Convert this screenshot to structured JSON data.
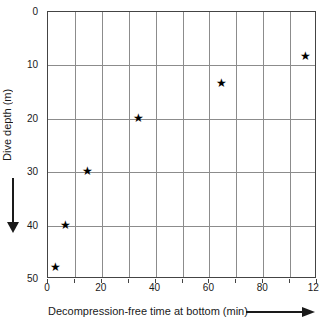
{
  "figure": {
    "background": "#ffffff",
    "text_color": "#1a1a1a",
    "grid_color": "#8c8c8c",
    "border_color": "#444444",
    "marker_glyph": "★",
    "marker_color": "#000000"
  },
  "chart_data": {
    "type": "scatter",
    "title": "",
    "xlabel": "Decompression-free time at bottom (min)",
    "ylabel": "Dive depth (m)",
    "x_tick_labels": [
      "0",
      "20",
      "40",
      "60",
      "80",
      "120"
    ],
    "x_tick_fracs": [
      0,
      0.2,
      0.4,
      0.6,
      0.8,
      1.0
    ],
    "y_tick_labels": [
      "0",
      "10",
      "20",
      "30",
      "40",
      "50"
    ],
    "y_tick_fracs": [
      0,
      0.2,
      0.4,
      0.6,
      0.8,
      1.0
    ],
    "x_cells": 10,
    "y_cells": 5,
    "grid": true,
    "y_axis_inverted": true,
    "ylim": [
      0,
      50
    ],
    "x_axis_segments": [
      {
        "t0": 0,
        "t1": 80,
        "f0": 0.0,
        "f1": 0.8
      },
      {
        "t0": 80,
        "t1": 120,
        "f0": 0.8,
        "f1": 1.0
      }
    ],
    "x_axis_note": "gridlines every 10 min up to 80; final gridline labeled 120",
    "points": [
      {
        "time_min": 3,
        "depth_m": 48
      },
      {
        "time_min": 7,
        "depth_m": 40
      },
      {
        "time_min": 15,
        "depth_m": 30
      },
      {
        "time_min": 34,
        "depth_m": 20
      },
      {
        "time_min": 65,
        "depth_m": 13.5
      },
      {
        "time_min": 112,
        "depth_m": 8.5
      }
    ]
  }
}
